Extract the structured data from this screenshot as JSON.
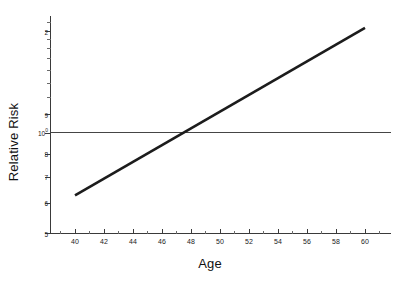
{
  "chart_data": {
    "type": "line",
    "title": "",
    "xlabel": "Age",
    "ylabel": "Relative Risk",
    "xlim": [
      38.6,
      61.6
    ],
    "ylim": [
      0.5,
      2.2
    ],
    "yscale": "log",
    "xscale": "linear",
    "grid": false,
    "legend": null,
    "xticks": [
      40,
      42,
      44,
      46,
      48,
      50,
      52,
      54,
      56,
      58,
      60
    ],
    "xtick_labels": [
      "40",
      "42",
      "44",
      "46",
      "48",
      "50",
      "52",
      "54",
      "56",
      "58",
      "60"
    ],
    "yticks": [
      0.5,
      0.6,
      0.7,
      0.8,
      0.9,
      1.0,
      2.0
    ],
    "ytick_labels": [
      "5",
      "6",
      "7",
      "8",
      "9",
      "10^0",
      "2"
    ],
    "ytick_label_display": [
      "5",
      "6",
      "7",
      "8",
      "9",
      "10⁰",
      "2"
    ],
    "series": [
      {
        "name": "Relative Risk",
        "style": "solid",
        "color": "#1c1c1c",
        "linewidth": 2.6,
        "x": [
          40,
          42,
          44,
          46,
          48,
          50,
          52,
          54,
          56,
          58,
          60
        ],
        "values": [
          0.65,
          0.725,
          0.81,
          0.905,
          1.01,
          1.13,
          1.26,
          1.41,
          1.575,
          1.76,
          2.05
        ]
      },
      {
        "name": "Reference line (RR = 1)",
        "style": "solid",
        "color": "#454545",
        "linewidth": 1.2,
        "x": [
          38.6,
          61.6
        ],
        "values": [
          1.0,
          1.0
        ]
      }
    ],
    "annotations": [
      {
        "text": "crossing point of risk line and reference line",
        "x": 47.8,
        "y": 1.0
      }
    ]
  },
  "axes": {
    "x_axis_name": "Age",
    "y_axis_name": "Relative Risk"
  }
}
